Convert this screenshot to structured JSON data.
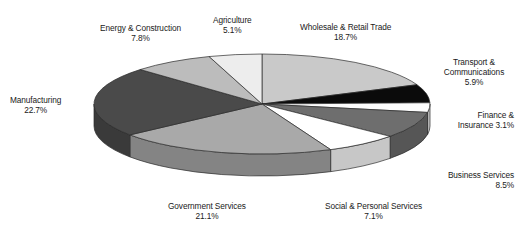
{
  "chart_data": {
    "type": "pie",
    "title": "",
    "subtitle": "",
    "xlabel": "",
    "ylabel": "",
    "legend_position": "none",
    "grid": false,
    "value_unit": "percent",
    "style": "3d-pie",
    "categories": [
      "Wholesale & Retail Trade",
      "Transport & Communications",
      "Finance & Insurance",
      "Business Services",
      "Social & Personal Services",
      "Government Services",
      "Manufacturing",
      "Energy & Construction",
      "Agriculture"
    ],
    "values": [
      18.7,
      5.9,
      3.1,
      8.5,
      7.1,
      21.1,
      22.7,
      7.8,
      5.1
    ],
    "value_labels": [
      "18.7%",
      "5.9%",
      "3.1%",
      "8.5%",
      "7.1%",
      "21.1%",
      "22.7%",
      "7.8%",
      "5.1%"
    ],
    "colors": [
      "#c9c9c9",
      "#0b0b0b",
      "#fdfdfd",
      "#6e6e6e",
      "#ffffff",
      "#a9a9a9",
      "#4a4a4a",
      "#bcbcbc",
      "#ededed"
    ],
    "slices": [
      {
        "label": "Wholesale & Retail Trade",
        "value": 18.7,
        "value_label": "18.7%",
        "color": "#c9c9c9"
      },
      {
        "label": "Transport & Communications",
        "value": 5.9,
        "value_label": "5.9%",
        "color": "#0b0b0b"
      },
      {
        "label": "Finance & Insurance",
        "value": 3.1,
        "value_label": "3.1%",
        "color": "#fdfdfd"
      },
      {
        "label": "Business Services",
        "value": 8.5,
        "value_label": "8.5%",
        "color": "#6e6e6e"
      },
      {
        "label": "Social & Personal Services",
        "value": 7.1,
        "value_label": "7.1%",
        "color": "#ffffff"
      },
      {
        "label": "Government Services",
        "value": 21.1,
        "value_label": "21.1%",
        "color": "#a9a9a9"
      },
      {
        "label": "Manufacturing",
        "value": 22.7,
        "value_label": "22.7%",
        "color": "#4a4a4a"
      },
      {
        "label": "Energy & Construction",
        "value": 7.8,
        "value_label": "7.8%",
        "color": "#bcbcbc"
      },
      {
        "label": "Agriculture",
        "value": 5.1,
        "value_label": "5.1%",
        "color": "#ededed"
      }
    ]
  },
  "labels": {
    "wholesale": {
      "line1": "Wholesale & Retail Trade",
      "line2": "18.7%"
    },
    "transport": {
      "line1": "Transport &",
      "line2": "Communications",
      "line3": "5.9%"
    },
    "finance": {
      "line1": "Finance &",
      "line2": "Insurance 3.1%"
    },
    "business": {
      "line1": "Business Services",
      "line2": "8.5%"
    },
    "social": {
      "line1": "Social & Personal Services",
      "line2": "7.1%"
    },
    "government": {
      "line1": "Government Services",
      "line2": "21.1%"
    },
    "manufacturing": {
      "line1": "Manufacturing",
      "line2": "22.7%"
    },
    "energy": {
      "line1": "Energy & Construction",
      "line2": "7.8%"
    },
    "agriculture": {
      "line1": "Agriculture",
      "line2": "5.1%"
    }
  }
}
